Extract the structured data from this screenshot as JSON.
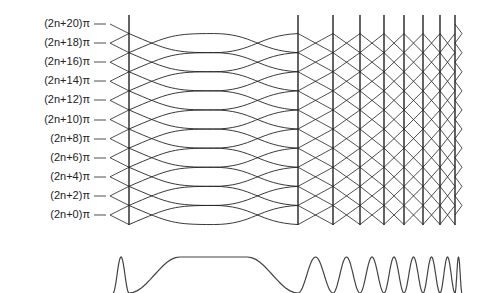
{
  "figure": {
    "labels": [
      "(2n+20)π",
      "(2n+18)π",
      "(2n+16)π",
      "(2n+14)π",
      "(2n+12)π",
      "(2n+10)π",
      "(2n+8)π",
      "(2n+6)π",
      "(2n+4)π",
      "(2n+2)π",
      "(2n+0)π"
    ],
    "label_y": [
      24,
      43,
      62,
      81,
      100,
      120,
      139,
      158,
      177,
      196,
      215
    ],
    "tick_x": [
      94,
      110
    ],
    "left_tip_x": 110,
    "verticals_x": [
      129,
      298,
      333,
      360,
      384,
      404,
      423,
      440,
      455
    ],
    "right_tip_x": 462,
    "vertical_top": 15,
    "vertical_bottom": 225,
    "line_color": "#222222",
    "waveform": {
      "baseline_y": 275,
      "amplitude": 18,
      "color": "#444444"
    }
  }
}
